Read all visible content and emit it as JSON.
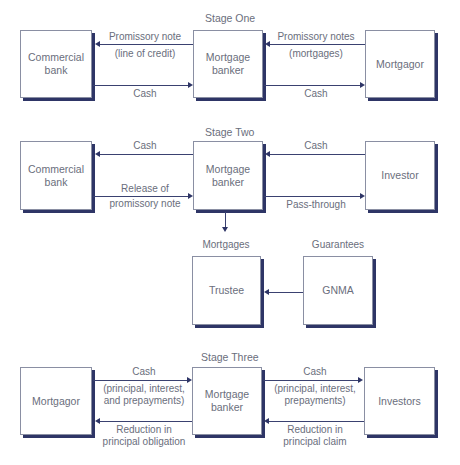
{
  "stages": {
    "one": {
      "title": "Stage One",
      "nodes": {
        "left": "Commercial bank",
        "middle": "Mortgage banker",
        "right": "Mortgagor"
      },
      "flows": {
        "mid_to_left_line1": "Promissory note",
        "mid_to_left_line2": "(line of credit)",
        "left_to_mid": "Cash",
        "right_to_mid_line1": "Promissory notes",
        "right_to_mid_line2": "(mortgages)",
        "mid_to_right": "Cash"
      }
    },
    "two": {
      "title": "Stage Two",
      "nodes": {
        "left": "Commercial bank",
        "middle": "Mortgage banker",
        "right": "Investor",
        "trustee": "Trustee",
        "gnma": "GNMA"
      },
      "flows": {
        "mid_to_left": "Cash",
        "left_to_mid_line1": "Release of",
        "left_to_mid_line2": "promissory note",
        "right_to_mid": "Cash",
        "mid_to_right": "Pass-through",
        "mid_to_trustee": "Mortgages",
        "gnma_label": "Guarantees"
      }
    },
    "three": {
      "title": "Stage Three",
      "nodes": {
        "left": "Mortgagor",
        "middle": "Mortgage banker",
        "right": "Investors"
      },
      "flows": {
        "left_to_mid_line1": "Cash",
        "left_to_mid_line2": "(principal, interest,",
        "left_to_mid_line3": "and prepayments)",
        "mid_to_left_line1": "Reduction in",
        "mid_to_left_line2": "principal obligation",
        "mid_to_right_line1": "Cash",
        "mid_to_right_line2": "(principal, interest,",
        "mid_to_right_line3": "prepayments)",
        "right_to_mid_line1": "Reduction in",
        "right_to_mid_line2": "principal claim"
      }
    }
  }
}
